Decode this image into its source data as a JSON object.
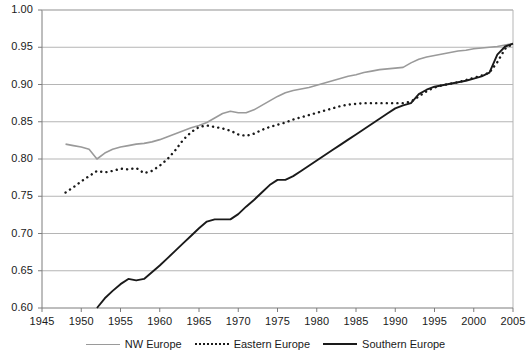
{
  "chart_data": {
    "type": "line",
    "title": "",
    "xlabel": "",
    "ylabel": "",
    "xlim": [
      1945,
      2005
    ],
    "ylim": [
      0.6,
      1.0
    ],
    "grid": true,
    "legend_position": "bottom-center",
    "x_ticks": [
      1945,
      1950,
      1955,
      1960,
      1965,
      1970,
      1975,
      1980,
      1985,
      1990,
      1995,
      2000,
      2005
    ],
    "y_ticks": [
      "0.60",
      "0.65",
      "0.70",
      "0.75",
      "0.80",
      "0.85",
      "0.90",
      "0.95",
      "1.00"
    ],
    "series": [
      {
        "name": "NW Europe",
        "color": "#9a9a9a",
        "style": "solid",
        "points": [
          [
            1948,
            0.82
          ],
          [
            1949,
            0.818
          ],
          [
            1950,
            0.816
          ],
          [
            1951,
            0.813
          ],
          [
            1952,
            0.8
          ],
          [
            1953,
            0.808
          ],
          [
            1954,
            0.813
          ],
          [
            1955,
            0.816
          ],
          [
            1956,
            0.818
          ],
          [
            1957,
            0.82
          ],
          [
            1958,
            0.821
          ],
          [
            1959,
            0.823
          ],
          [
            1960,
            0.826
          ],
          [
            1961,
            0.83
          ],
          [
            1962,
            0.834
          ],
          [
            1963,
            0.838
          ],
          [
            1964,
            0.842
          ],
          [
            1965,
            0.845
          ],
          [
            1966,
            0.849
          ],
          [
            1967,
            0.855
          ],
          [
            1968,
            0.861
          ],
          [
            1969,
            0.864
          ],
          [
            1970,
            0.862
          ],
          [
            1971,
            0.862
          ],
          [
            1972,
            0.866
          ],
          [
            1973,
            0.872
          ],
          [
            1974,
            0.878
          ],
          [
            1975,
            0.884
          ],
          [
            1976,
            0.889
          ],
          [
            1977,
            0.892
          ],
          [
            1978,
            0.894
          ],
          [
            1979,
            0.896
          ],
          [
            1980,
            0.899
          ],
          [
            1981,
            0.902
          ],
          [
            1982,
            0.905
          ],
          [
            1983,
            0.908
          ],
          [
            1984,
            0.911
          ],
          [
            1985,
            0.913
          ],
          [
            1986,
            0.916
          ],
          [
            1987,
            0.918
          ],
          [
            1988,
            0.92
          ],
          [
            1989,
            0.921
          ],
          [
            1990,
            0.922
          ],
          [
            1991,
            0.923
          ],
          [
            1992,
            0.929
          ],
          [
            1993,
            0.934
          ],
          [
            1994,
            0.937
          ],
          [
            1995,
            0.939
          ],
          [
            1996,
            0.941
          ],
          [
            1997,
            0.943
          ],
          [
            1998,
            0.945
          ],
          [
            1999,
            0.946
          ],
          [
            2000,
            0.948
          ],
          [
            2001,
            0.949
          ],
          [
            2002,
            0.95
          ],
          [
            2003,
            0.951
          ],
          [
            2004,
            0.953
          ],
          [
            2005,
            0.955
          ]
        ]
      },
      {
        "name": "Eastern Europe",
        "color": "#1a1a1a",
        "style": "dotted",
        "points": [
          [
            1948,
            0.755
          ],
          [
            1949,
            0.762
          ],
          [
            1950,
            0.77
          ],
          [
            1951,
            0.777
          ],
          [
            1952,
            0.784
          ],
          [
            1953,
            0.782
          ],
          [
            1954,
            0.784
          ],
          [
            1955,
            0.787
          ],
          [
            1956,
            0.786
          ],
          [
            1957,
            0.788
          ],
          [
            1958,
            0.781
          ],
          [
            1959,
            0.784
          ],
          [
            1960,
            0.791
          ],
          [
            1961,
            0.8
          ],
          [
            1962,
            0.812
          ],
          [
            1963,
            0.826
          ],
          [
            1964,
            0.836
          ],
          [
            1965,
            0.843
          ],
          [
            1966,
            0.845
          ],
          [
            1967,
            0.843
          ],
          [
            1968,
            0.841
          ],
          [
            1969,
            0.838
          ],
          [
            1970,
            0.833
          ],
          [
            1971,
            0.831
          ],
          [
            1972,
            0.834
          ],
          [
            1973,
            0.839
          ],
          [
            1974,
            0.843
          ],
          [
            1975,
            0.846
          ],
          [
            1976,
            0.849
          ],
          [
            1977,
            0.853
          ],
          [
            1978,
            0.856
          ],
          [
            1979,
            0.859
          ],
          [
            1980,
            0.862
          ],
          [
            1981,
            0.865
          ],
          [
            1982,
            0.868
          ],
          [
            1983,
            0.871
          ],
          [
            1984,
            0.873
          ],
          [
            1985,
            0.874
          ],
          [
            1986,
            0.875
          ],
          [
            1987,
            0.875
          ],
          [
            1988,
            0.875
          ],
          [
            1989,
            0.875
          ],
          [
            1990,
            0.875
          ],
          [
            1991,
            0.875
          ],
          [
            1992,
            0.877
          ],
          [
            1993,
            0.884
          ],
          [
            1994,
            0.891
          ],
          [
            1995,
            0.896
          ],
          [
            1996,
            0.899
          ],
          [
            1997,
            0.901
          ],
          [
            1998,
            0.903
          ],
          [
            1999,
            0.906
          ],
          [
            2000,
            0.909
          ],
          [
            2001,
            0.912
          ],
          [
            2002,
            0.916
          ],
          [
            2003,
            0.93
          ],
          [
            2004,
            0.948
          ],
          [
            2005,
            0.955
          ]
        ]
      },
      {
        "name": "Southern Europe",
        "color": "#1a1a1a",
        "style": "solid",
        "points": [
          [
            1952,
            0.6
          ],
          [
            1953,
            0.613
          ],
          [
            1954,
            0.623
          ],
          [
            1955,
            0.632
          ],
          [
            1956,
            0.639
          ],
          [
            1957,
            0.637
          ],
          [
            1958,
            0.639
          ],
          [
            1959,
            0.648
          ],
          [
            1960,
            0.657
          ],
          [
            1961,
            0.667
          ],
          [
            1962,
            0.677
          ],
          [
            1963,
            0.687
          ],
          [
            1964,
            0.697
          ],
          [
            1965,
            0.707
          ],
          [
            1966,
            0.716
          ],
          [
            1967,
            0.719
          ],
          [
            1968,
            0.719
          ],
          [
            1969,
            0.719
          ],
          [
            1970,
            0.726
          ],
          [
            1971,
            0.736
          ],
          [
            1972,
            0.745
          ],
          [
            1973,
            0.755
          ],
          [
            1974,
            0.765
          ],
          [
            1975,
            0.772
          ],
          [
            1976,
            0.772
          ],
          [
            1977,
            0.777
          ],
          [
            1978,
            0.784
          ],
          [
            1979,
            0.791
          ],
          [
            1980,
            0.798
          ],
          [
            1981,
            0.805
          ],
          [
            1982,
            0.812
          ],
          [
            1983,
            0.819
          ],
          [
            1984,
            0.826
          ],
          [
            1985,
            0.833
          ],
          [
            1986,
            0.84
          ],
          [
            1987,
            0.847
          ],
          [
            1988,
            0.854
          ],
          [
            1989,
            0.861
          ],
          [
            1990,
            0.868
          ],
          [
            1991,
            0.872
          ],
          [
            1992,
            0.875
          ],
          [
            1993,
            0.887
          ],
          [
            1994,
            0.893
          ],
          [
            1995,
            0.897
          ],
          [
            1996,
            0.899
          ],
          [
            1997,
            0.901
          ],
          [
            1998,
            0.903
          ],
          [
            1999,
            0.905
          ],
          [
            2000,
            0.908
          ],
          [
            2001,
            0.911
          ],
          [
            2002,
            0.916
          ],
          [
            2003,
            0.94
          ],
          [
            2004,
            0.951
          ],
          [
            2005,
            0.955
          ]
        ]
      }
    ]
  },
  "legend": {
    "items": [
      {
        "label": "NW Europe"
      },
      {
        "label": "Eastern Europe"
      },
      {
        "label": "Southern Europe"
      }
    ]
  }
}
